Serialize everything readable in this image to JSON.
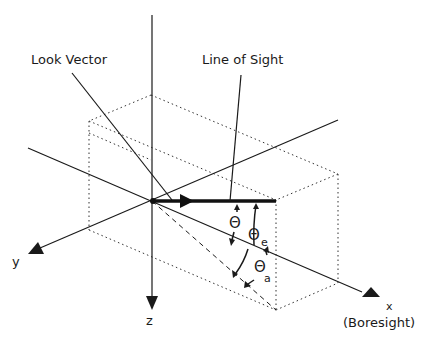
{
  "diagram": {
    "type": "3D coordinate geometry diagram",
    "labels": {
      "look_vector": "Look Vector",
      "line_of_sight": "Line of Sight",
      "x_axis": "x",
      "x_axis_note": "(Boresight)",
      "y_axis": "y",
      "z_axis": "z",
      "theta": "Θ",
      "theta_e": "Θ",
      "theta_e_sub": "e",
      "theta_a": "Θ",
      "theta_a_sub": "a"
    },
    "elements": [
      {
        "name": "x-axis",
        "role": "Boresight axis, arrow toward lower right"
      },
      {
        "name": "y-axis",
        "role": "axis, arrow toward lower left"
      },
      {
        "name": "z-axis",
        "role": "vertical axis, arrow pointing down"
      },
      {
        "name": "line-of-sight",
        "role": "thick horizontal vector from origin"
      },
      {
        "name": "look-vector",
        "role": "line from upper left into origin"
      },
      {
        "name": "projection-dashed",
        "role": "dashed projection of line of sight"
      },
      {
        "name": "bounding-box",
        "role": "dotted 3D box"
      }
    ],
    "angles": [
      {
        "symbol": "Θ",
        "subscript": "",
        "between": "line of sight and x-axis"
      },
      {
        "symbol": "Θ",
        "subscript": "e",
        "between": "elevation angle"
      },
      {
        "symbol": "Θ",
        "subscript": "a",
        "between": "azimuth angle"
      }
    ],
    "colors": {
      "stroke": "#1a1a1a",
      "background": "#ffffff"
    }
  }
}
